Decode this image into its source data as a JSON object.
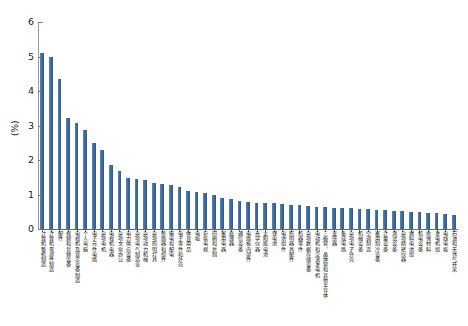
{
  "chart_data": {
    "type": "bar",
    "title": "",
    "xlabel": "",
    "ylabel": "(%)",
    "ylim": [
      0,
      6
    ],
    "ytick_labels": [
      "0",
      "1",
      "2",
      "3",
      "4",
      "5",
      "6"
    ],
    "ytick_values": [
      0,
      1,
      2,
      3,
      4,
      5,
      6
    ],
    "grid": false,
    "legend": false,
    "bar_color": "#4272a8",
    "axis_color": "#6b6b6b",
    "categories": [
      "计算机整机制造",
      "计算机零部件制造",
      "配件",
      "视频和音频设备",
      "电视机及显示设备制造",
      "个人电脑",
      "电子元件电路",
      "杂项电机",
      "电视机电器",
      "杂项文化办公",
      "电力供应设备",
      "杂项电气制造业",
      "杂项动力机械",
      "杂项照明灯具",
      "断路器和组件",
      "输电和配电",
      "电子零件和外壳",
      "体育用品",
      "电缆",
      "彩色电视",
      "印刷和复制",
      "家用电器",
      "处理器",
      "通信设备",
      "电路板内部件",
      "光学仪器",
      "太阳能电池",
      "锂电池",
      "电池组件",
      "照明器具配件",
      "机器零件",
      "杂项数据存储设备",
      "电动机和交流发电机",
      "三极管、晶体管和其他半导体",
      "变压器",
      "集成电路",
      "杂项电子外壳",
      "机械设备",
      "空调制造",
      "家用制冷设备",
      "计量设备",
      "测试设备",
      "杂项精密仪器",
      "燃料电池组",
      "机电设备",
      "绝缘材料",
      "发电机组",
      "电线电缆",
      "石油和天然气开采"
    ],
    "values": [
      5.1,
      5.0,
      4.35,
      3.22,
      3.08,
      2.88,
      2.5,
      2.28,
      1.87,
      1.68,
      1.49,
      1.45,
      1.41,
      1.34,
      1.31,
      1.28,
      1.22,
      1.09,
      1.08,
      1.05,
      1.0,
      0.91,
      0.88,
      0.8,
      0.78,
      0.76,
      0.75,
      0.74,
      0.72,
      0.7,
      0.69,
      0.67,
      0.65,
      0.64,
      0.62,
      0.61,
      0.6,
      0.59,
      0.57,
      0.56,
      0.55,
      0.53,
      0.52,
      0.5,
      0.49,
      0.47,
      0.45,
      0.44,
      0.42
    ]
  }
}
